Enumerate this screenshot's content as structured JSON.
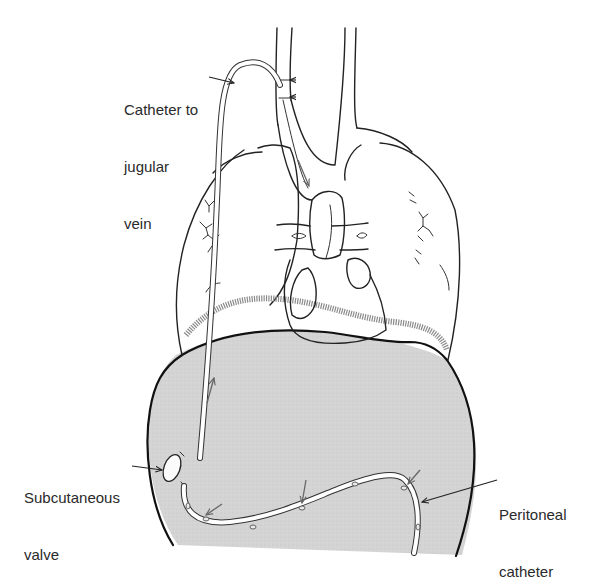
{
  "figure": {
    "colors": {
      "ink": "#222222",
      "abdomen_fill": "#d2d2d2",
      "background": "#ffffff",
      "flow_arrow": "#666666"
    }
  },
  "labels": {
    "catheter_to_jugular_vein": [
      "Catheter to",
      "jugular",
      "vein"
    ],
    "subcutaneous_valve": [
      "Subcutaneous",
      "valve"
    ],
    "peritoneal_catheter": [
      "Peritoneal",
      "catheter"
    ]
  }
}
